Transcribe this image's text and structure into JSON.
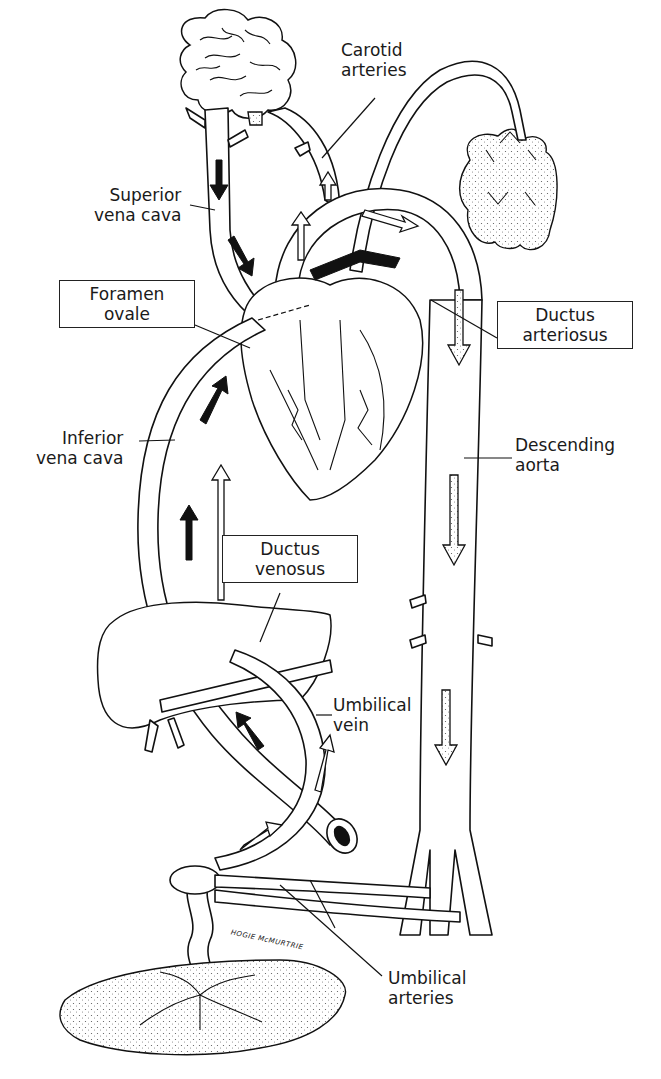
{
  "colors": {
    "line": "#111111",
    "background": "#ffffff"
  },
  "labels": {
    "carotid_arteries": [
      "Carotid",
      "arteries"
    ],
    "superior_vena_cava": [
      "Superior",
      "vena cava"
    ],
    "foramen_ovale": [
      "Foramen",
      "ovale"
    ],
    "ductus_arteriosus": [
      "Ductus",
      "arteriosus"
    ],
    "inferior_vena_cava": [
      "Inferior",
      "vena cava"
    ],
    "descending_aorta": [
      "Descending",
      "aorta"
    ],
    "ductus_venosus": [
      "Ductus",
      "venosus"
    ],
    "umbilical_vein": [
      "Umbilical",
      "vein"
    ],
    "umbilical_arteries": [
      "Umbilical",
      "arteries"
    ]
  },
  "signature": "HOGIE McMURTRIE",
  "structures": [
    "brain",
    "lungs",
    "heart",
    "liver",
    "placenta",
    "umbilical cord",
    "descending aorta",
    "inferior vena cava",
    "superior vena cava"
  ],
  "legend_arrows": {
    "black": "deoxygenated blood",
    "white": "oxygenated blood",
    "stippled": "mixed blood"
  }
}
